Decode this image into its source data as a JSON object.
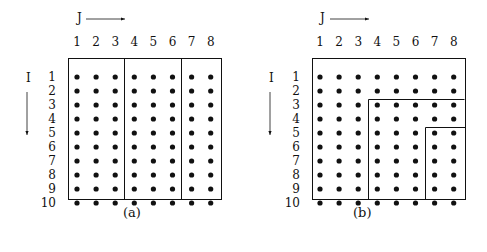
{
  "panels": [
    {
      "id": "a",
      "caption": "(a)",
      "column_axis_label": "J",
      "row_axis_label": "I",
      "column_labels": [
        "1",
        "2",
        "3",
        "4",
        "5",
        "6",
        "7",
        "8"
      ],
      "row_labels": [
        "1",
        "2",
        "3",
        "4",
        "5",
        "6",
        "7",
        "8",
        "9",
        "10"
      ],
      "partition": "column blocks: columns 1-3 | 4-6 | 7-8"
    },
    {
      "id": "b",
      "caption": "(b)",
      "column_axis_label": "J",
      "row_axis_label": "I",
      "column_labels": [
        "1",
        "2",
        "3",
        "4",
        "5",
        "6",
        "7",
        "8"
      ],
      "row_labels": [
        "1",
        "2",
        "3",
        "4",
        "5",
        "6",
        "7",
        "8",
        "9",
        "10"
      ],
      "partition": "staircase: region from row 3 & column 4 onward; nested region from row 5 & column 7 onward"
    }
  ],
  "colors": {
    "ink": "#111111",
    "background": "#ffffff"
  }
}
